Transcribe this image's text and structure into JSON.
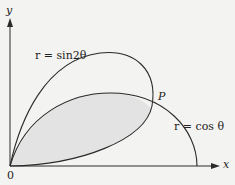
{
  "diagram": {
    "axis_x_label": "x",
    "axis_y_label": "y",
    "origin_label": "0",
    "curve1_label": "r = sin2θ",
    "curve2_label": "r = cos θ",
    "point_label": "P",
    "shaded_region": "intersection of r = sin2θ and r = cos θ interiors",
    "colors": {
      "line": "#2a2a2a",
      "shade": "#e2e2e2",
      "background": "#f3f3f1"
    }
  }
}
